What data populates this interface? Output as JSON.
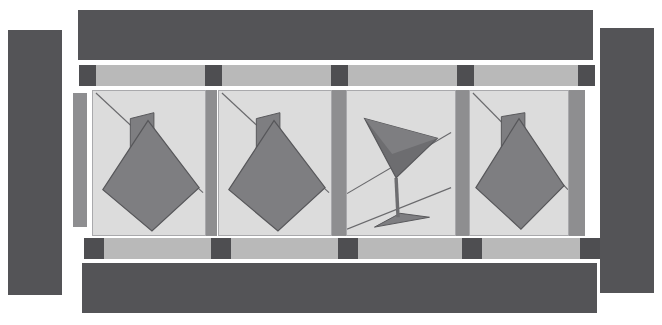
{
  "canvas": {
    "width": 662,
    "height": 325,
    "background": "#ffffff",
    "title": "Abstract geometric filmstrip composition"
  },
  "palette": {
    "dark_gray": "#545457",
    "dark_cell": "#4e4e51",
    "mid_gray": "#8e8e90",
    "light_gray": "#b9b9b9",
    "panel_bg": "#dcdcdc",
    "panel_border": "#a9a9ac",
    "shape_fill": "#7e7e81",
    "shape_fill_dark": "#6d6d70",
    "shape_stroke": "#57575a",
    "line_stroke": "#6a6a6d"
  },
  "frame": {
    "left_bar": {
      "label": "left-vertical-bar",
      "x": 8,
      "y": 30,
      "w": 54,
      "h": 265,
      "color": "#545457"
    },
    "right_bar": {
      "label": "right-vertical-bar",
      "x": 600,
      "y": 28,
      "w": 54,
      "h": 265,
      "color": "#545457"
    },
    "top_bar": {
      "label": "top-horizontal-bar",
      "x": 78,
      "y": 10,
      "w": 515,
      "h": 50,
      "color": "#545457"
    },
    "bottom_bar": {
      "label": "bottom-horizontal-bar",
      "x": 82,
      "y": 263,
      "w": 515,
      "h": 50,
      "color": "#545457"
    }
  },
  "top_strip": {
    "label": "top-perforation-strip",
    "x": 79,
    "y": 65,
    "w": 516,
    "h": 21,
    "segments": [
      {
        "kind": "dark",
        "width": 17
      },
      {
        "kind": "light",
        "width": 109
      },
      {
        "kind": "dark",
        "width": 17
      },
      {
        "kind": "light",
        "width": 109
      },
      {
        "kind": "dark",
        "width": 17
      },
      {
        "kind": "light",
        "width": 109
      },
      {
        "kind": "dark",
        "width": 17
      },
      {
        "kind": "light",
        "width": 104
      },
      {
        "kind": "dark",
        "width": 17
      }
    ]
  },
  "bottom_strip": {
    "label": "bottom-perforation-strip",
    "x": 84,
    "y": 238,
    "w": 516,
    "h": 21,
    "segments": [
      {
        "kind": "dark",
        "width": 20
      },
      {
        "kind": "light",
        "width": 107
      },
      {
        "kind": "dark",
        "width": 20
      },
      {
        "kind": "light",
        "width": 107
      },
      {
        "kind": "dark",
        "width": 20
      },
      {
        "kind": "light",
        "width": 104
      },
      {
        "kind": "dark",
        "width": 20
      },
      {
        "kind": "light",
        "width": 98
      },
      {
        "kind": "dark",
        "width": 20
      }
    ]
  },
  "side_rail": {
    "label": "left-inner-rail",
    "x": 73,
    "y": 93,
    "w": 14,
    "h": 134,
    "color": "#8e8e90"
  },
  "separators": [
    {
      "label": "separator-1",
      "x": 203,
      "y": 90,
      "w": 14,
      "h": 146
    },
    {
      "label": "separator-2",
      "x": 332,
      "y": 90,
      "w": 14,
      "h": 146
    },
    {
      "label": "separator-3",
      "x": 455,
      "y": 90,
      "w": 14,
      "h": 146
    },
    {
      "label": "separator-4",
      "x": 569,
      "y": 90,
      "w": 16,
      "h": 146
    }
  ],
  "panels": [
    {
      "id": "panel-1",
      "label": "panel-kite-1",
      "x": 92,
      "y": 90,
      "w": 114,
      "h": 146,
      "figure": "kite-shape",
      "figure_label": "Rotated kite / diamond with stem",
      "diagonal_line": {
        "x1": 3,
        "y1": 2,
        "x2": 112,
        "y2": 103
      },
      "stem": "38,28 62,22 62,62 38,62",
      "body": "10,100 56,30 108,98 60,142"
    },
    {
      "id": "panel-2",
      "label": "panel-kite-2",
      "x": 218,
      "y": 90,
      "w": 114,
      "h": 146,
      "figure": "kite-shape",
      "figure_label": "Rotated kite / diamond with stem",
      "diagonal_line": {
        "x1": 3,
        "y1": 2,
        "x2": 112,
        "y2": 103
      },
      "stem": "38,28 62,22 62,62 38,62",
      "body": "10,100 56,30 108,98 60,142"
    },
    {
      "id": "panel-3",
      "label": "panel-martini-glass",
      "x": 346,
      "y": 90,
      "w": 110,
      "h": 146,
      "figure": "martini-glass",
      "figure_label": "Martini glass / cocktail glass",
      "bowl": "18,28 92,48 50,88",
      "bowl_shade": "18,28 92,48 46,64",
      "stem_line": {
        "x1": 50,
        "y1": 88,
        "x2": 52,
        "y2": 128
      },
      "base": "28,138 84,128 54,124",
      "lines": [
        {
          "x1": 0,
          "y1": 104,
          "x2": 106,
          "y2": 42
        },
        {
          "x1": 0,
          "y1": 140,
          "x2": 106,
          "y2": 98
        }
      ]
    },
    {
      "id": "panel-4",
      "label": "panel-kite-3",
      "x": 469,
      "y": 90,
      "w": 100,
      "h": 146,
      "figure": "kite-shape",
      "figure_label": "Rotated kite / diamond with stem",
      "diagonal_line": {
        "x1": 3,
        "y1": 2,
        "x2": 100,
        "y2": 100
      },
      "stem": "32,26 56,22 56,58 32,58",
      "body": "6,98 50,28 96,96 52,140"
    }
  ]
}
